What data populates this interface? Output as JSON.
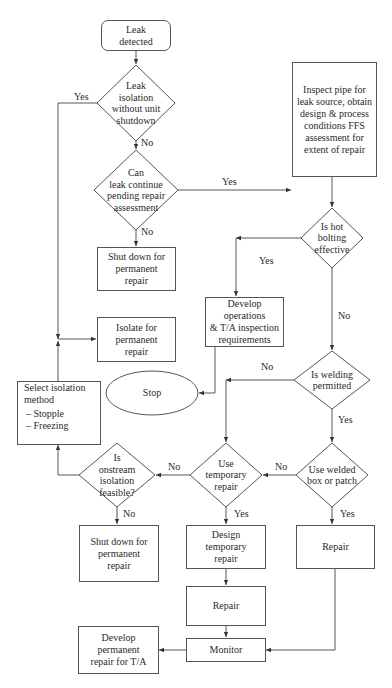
{
  "diagram": {
    "type": "flowchart",
    "nodes": {
      "start": {
        "shape": "rounded-rect",
        "text": "Leak detected",
        "lines": [
          "Leak",
          "detected"
        ]
      },
      "d_isolation": {
        "shape": "diamond",
        "lines": [
          "Leak",
          "isolation",
          "without unit",
          "shutdown"
        ]
      },
      "d_continue": {
        "shape": "diamond",
        "lines": [
          "Can",
          "leak continue",
          "pending repair",
          "assessment"
        ]
      },
      "inspect": {
        "shape": "rect",
        "lines": [
          "Inspect pipe for",
          "leak source, obtain",
          "design & process",
          "conditions FFS",
          "assessment for",
          "extent of repair"
        ]
      },
      "shutdown1": {
        "shape": "rect",
        "lines": [
          "Shut down for",
          "permanent",
          "repair"
        ]
      },
      "isolate": {
        "shape": "rect",
        "lines": [
          "Isolate for",
          "permanent",
          "repair"
        ]
      },
      "d_hotbolting": {
        "shape": "diamond",
        "lines": [
          "Is hot",
          "bolting",
          "effective"
        ]
      },
      "develop_ops": {
        "shape": "rect",
        "lines": [
          "Develop operations",
          "& T/A inspection",
          "requirements"
        ]
      },
      "stop": {
        "shape": "ellipse",
        "text": "Stop"
      },
      "select_isolation": {
        "shape": "rect",
        "title_lines": [
          "Select isolation",
          "method"
        ],
        "items": [
          "–  Stopple",
          "–  Freezing"
        ]
      },
      "d_welding": {
        "shape": "diamond",
        "lines": [
          "Is welding",
          "permitted"
        ]
      },
      "d_onstream": {
        "shape": "diamond",
        "lines": [
          "Is",
          "onstream",
          "isolation",
          "feasible?"
        ]
      },
      "d_temp": {
        "shape": "diamond",
        "lines": [
          "Use",
          "temporary",
          "repair"
        ]
      },
      "d_welded": {
        "shape": "diamond",
        "lines": [
          "Use welded",
          "box or patch"
        ]
      },
      "shutdown2": {
        "shape": "rect",
        "lines": [
          "Shut down for",
          "permanent",
          "repair"
        ]
      },
      "design_temp": {
        "shape": "rect",
        "lines": [
          "Design",
          "temporary",
          "repair"
        ]
      },
      "repair_right": {
        "shape": "rect",
        "text": "Repair"
      },
      "repair_mid": {
        "shape": "rect",
        "text": "Repair"
      },
      "monitor": {
        "shape": "rect",
        "text": "Monitor"
      },
      "develop_perm": {
        "shape": "rect",
        "lines": [
          "Develop",
          "permanent",
          "repair for T/A"
        ]
      }
    },
    "edge_labels": {
      "isolation_yes": "Yes",
      "isolation_no": "No",
      "continue_yes": "Yes",
      "continue_no": "No",
      "hotbolting_yes": "Yes",
      "hotbolting_no": "No",
      "welding_no": "No",
      "welding_yes": "Yes",
      "onstream_no_left": "No",
      "onstream_no_down": "No",
      "welded_no": "No",
      "welded_yes": "Yes",
      "temp_yes": "Yes"
    },
    "edges": [
      {
        "from": "start",
        "to": "d_isolation"
      },
      {
        "from": "d_isolation",
        "to": "d_continue",
        "label": "No"
      },
      {
        "from": "d_isolation",
        "to": "isolate",
        "label": "Yes"
      },
      {
        "from": "d_continue",
        "to": "inspect",
        "label": "Yes"
      },
      {
        "from": "d_continue",
        "to": "shutdown1",
        "label": "No"
      },
      {
        "from": "inspect",
        "to": "d_hotbolting"
      },
      {
        "from": "d_hotbolting",
        "to": "develop_ops",
        "label": "Yes"
      },
      {
        "from": "d_hotbolting",
        "to": "d_welding",
        "label": "No"
      },
      {
        "from": "develop_ops",
        "to": "stop"
      },
      {
        "from": "d_welding",
        "to": "d_temp",
        "label": "No"
      },
      {
        "from": "d_welding",
        "to": "d_welded",
        "label": "Yes"
      },
      {
        "from": "d_welded",
        "to": "d_temp",
        "label": "No"
      },
      {
        "from": "d_welded",
        "to": "repair_right",
        "label": "Yes"
      },
      {
        "from": "d_temp",
        "to": "d_onstream",
        "label": "No"
      },
      {
        "from": "d_temp",
        "to": "design_temp",
        "label": "Yes"
      },
      {
        "from": "d_onstream",
        "to": "select_isolation",
        "label": "No"
      },
      {
        "from": "d_onstream",
        "to": "shutdown2",
        "label": "No"
      },
      {
        "from": "select_isolation",
        "to": "isolate"
      },
      {
        "from": "design_temp",
        "to": "repair_mid"
      },
      {
        "from": "repair_mid",
        "to": "monitor"
      },
      {
        "from": "repair_right",
        "to": "monitor"
      },
      {
        "from": "monitor",
        "to": "develop_perm"
      }
    ]
  }
}
